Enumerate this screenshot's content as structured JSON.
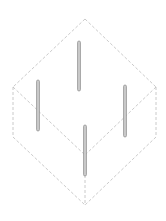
{
  "diagram": {
    "type": "isometric-cube-with-rods",
    "width": 166,
    "height": 221,
    "colors": {
      "background": "#ffffff",
      "edge": "#bdbdbd",
      "rod_fill": "#c8c8c8",
      "rod_stroke": "#8f8f8f"
    },
    "vertices": {
      "top": [
        85,
        19
      ],
      "left": [
        13,
        87
      ],
      "right": [
        156,
        87
      ],
      "center": [
        85,
        155
      ],
      "bottom_left": [
        13,
        137
      ],
      "bottom_right": [
        156,
        137
      ],
      "bottom": [
        85,
        205
      ]
    },
    "edges": [
      [
        "top",
        "left"
      ],
      [
        "top",
        "right"
      ],
      [
        "left",
        "bottom_left"
      ],
      [
        "right",
        "bottom_right"
      ],
      [
        "bottom_left",
        "bottom"
      ],
      [
        "bottom_right",
        "bottom"
      ],
      [
        "left",
        "center"
      ],
      [
        "right",
        "center"
      ],
      [
        "center",
        "bottom"
      ]
    ],
    "rods": [
      {
        "name": "rod-back",
        "x": 79,
        "y1": 41,
        "y2": 91
      },
      {
        "name": "rod-left",
        "x": 38,
        "y1": 80,
        "y2": 131
      },
      {
        "name": "rod-right",
        "x": 125,
        "y1": 85,
        "y2": 137
      },
      {
        "name": "rod-front",
        "x": 85,
        "y1": 125,
        "y2": 176
      }
    ],
    "rod_width": 3,
    "dash": "3,2"
  }
}
